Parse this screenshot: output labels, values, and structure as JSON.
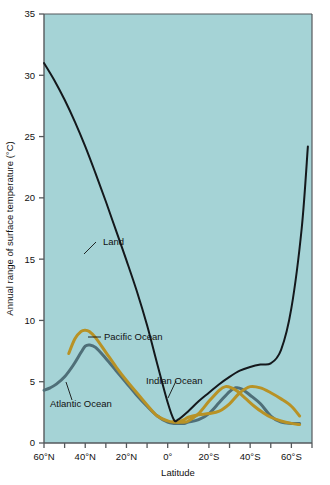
{
  "chart_data": {
    "type": "line",
    "title": "",
    "xlabel": "Latitude",
    "ylabel": "Annual range of surface temperature (°C)",
    "xlim": [
      60,
      -70
    ],
    "ylim": [
      0,
      35
    ],
    "grid": false,
    "legend_position": "inline-annotations",
    "plot_background_color": "#a5d3d6",
    "xticks": [
      {
        "value": 60,
        "label": "60°N"
      },
      {
        "value": 50,
        "label": ""
      },
      {
        "value": 40,
        "label": "40°N"
      },
      {
        "value": 30,
        "label": ""
      },
      {
        "value": 20,
        "label": "20°N"
      },
      {
        "value": 10,
        "label": ""
      },
      {
        "value": 0,
        "label": "0°"
      },
      {
        "value": -10,
        "label": ""
      },
      {
        "value": -20,
        "label": "20°S"
      },
      {
        "value": -30,
        "label": ""
      },
      {
        "value": -40,
        "label": "40°S"
      },
      {
        "value": -50,
        "label": ""
      },
      {
        "value": -60,
        "label": "60°S"
      },
      {
        "value": -70,
        "label": ""
      }
    ],
    "yticks": [
      {
        "value": 0,
        "label": "0"
      },
      {
        "value": 5,
        "label": "5"
      },
      {
        "value": 10,
        "label": "10"
      },
      {
        "value": 15,
        "label": "15"
      },
      {
        "value": 20,
        "label": "20"
      },
      {
        "value": 25,
        "label": "25"
      },
      {
        "value": 30,
        "label": "30"
      },
      {
        "value": 35,
        "label": "35"
      }
    ],
    "series": [
      {
        "name": "Land",
        "color": "#14181c",
        "width": 2.0,
        "label": "Land",
        "x": [
          60,
          55,
          50,
          45,
          40,
          35,
          30,
          25,
          20,
          15,
          10,
          5,
          0,
          -3,
          -5,
          -10,
          -15,
          -20,
          -25,
          -30,
          -35,
          -40,
          -45,
          -50,
          -55,
          -60,
          -65,
          -68
        ],
        "y": [
          31.0,
          29.6,
          28.0,
          26.2,
          24.2,
          22.0,
          19.7,
          17.3,
          14.9,
          12.4,
          9.6,
          6.4,
          3.3,
          1.9,
          1.9,
          2.6,
          3.4,
          4.1,
          4.8,
          5.4,
          5.9,
          6.2,
          6.4,
          6.5,
          7.6,
          11.0,
          17.5,
          24.2
        ]
      },
      {
        "name": "Pacific Ocean",
        "color": "#b89225",
        "width": 3.0,
        "label": "Pacific Ocean",
        "x": [
          48,
          45,
          42,
          40,
          38,
          35,
          30,
          25,
          20,
          15,
          10,
          5,
          0,
          -3,
          -5,
          -8,
          -10,
          -15,
          -20,
          -25,
          -30,
          -35,
          -40,
          -45,
          -50,
          -55,
          -60,
          -64
        ],
        "y": [
          7.3,
          8.5,
          9.1,
          9.2,
          9.1,
          8.6,
          7.4,
          6.2,
          5.1,
          4.1,
          3.1,
          2.2,
          1.8,
          1.7,
          1.7,
          1.9,
          2.1,
          2.3,
          2.4,
          2.6,
          3.2,
          4.1,
          4.6,
          4.5,
          4.1,
          3.6,
          3.0,
          2.2
        ]
      },
      {
        "name": "Atlantic Ocean",
        "color": "#4f6f78",
        "width": 3.0,
        "label": "Atlantic Ocean",
        "x": [
          60,
          57,
          54,
          50,
          46,
          42,
          40,
          38,
          35,
          30,
          25,
          20,
          15,
          10,
          5,
          0,
          -3,
          -5,
          -8,
          -10,
          -15,
          -20,
          -25,
          -30,
          -33,
          -36,
          -40,
          -45,
          -50,
          -55,
          -60,
          -64
        ],
        "y": [
          4.3,
          4.5,
          4.8,
          5.4,
          6.3,
          7.4,
          7.9,
          8.0,
          7.8,
          6.9,
          5.9,
          4.9,
          3.9,
          3.0,
          2.2,
          1.7,
          1.6,
          1.6,
          1.6,
          1.7,
          1.9,
          2.4,
          3.3,
          4.2,
          4.5,
          4.4,
          3.9,
          3.2,
          2.2,
          1.7,
          1.6,
          1.6
        ]
      },
      {
        "name": "Indian Ocean",
        "color": "#b89225",
        "width": 3.0,
        "label": "Indian Ocean",
        "x": [
          -3,
          -5,
          -8,
          -10,
          -15,
          -20,
          -25,
          -28,
          -31,
          -34,
          -38,
          -42,
          -46,
          -50,
          -55,
          -60,
          -64
        ],
        "y": [
          1.8,
          1.7,
          1.7,
          1.8,
          2.4,
          3.4,
          4.3,
          4.6,
          4.5,
          4.2,
          3.6,
          3.0,
          2.5,
          2.1,
          1.8,
          1.6,
          1.5
        ]
      }
    ],
    "annotations": [
      {
        "text": "Land",
        "x_px": 103,
        "y_px": 245
      },
      {
        "text": "Pacific Ocean",
        "x_px": 104,
        "y_px": 340
      },
      {
        "text": "Atlantic Ocean",
        "x_px": 50,
        "y_px": 407
      },
      {
        "text": "Indian Ocean",
        "x_px": 146,
        "y_px": 384
      }
    ]
  }
}
